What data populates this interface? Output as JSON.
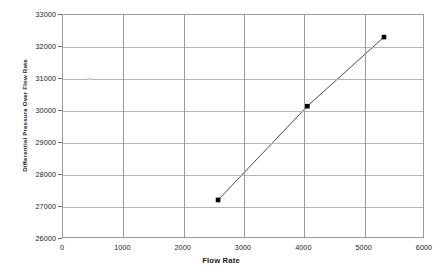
{
  "chart_data": {
    "type": "line",
    "title": "",
    "xlabel": "Flow Rate",
    "ylabel": "Differential Pressure Over Flow Rate",
    "xlim": [
      0,
      6000
    ],
    "ylim": [
      26000,
      33000
    ],
    "xticks": [
      0,
      1000,
      2000,
      3000,
      4000,
      5000,
      6000
    ],
    "yticks": [
      26000,
      27000,
      28000,
      29000,
      30000,
      31000,
      32000,
      33000
    ],
    "xtick_labels": [
      "0",
      "1000",
      "2000",
      "3000",
      "4000",
      "5000",
      "6000"
    ],
    "ytick_labels": [
      "26000",
      "27000",
      "28000",
      "29000",
      "30000",
      "31000",
      "32000",
      "33000"
    ],
    "grid": true,
    "legend": false,
    "legend_position": "none",
    "marker": "square",
    "marker_color": "#000000",
    "line_color": "#4a4a4a",
    "series": [
      {
        "name": "Differential Pressure Over Flow Rate",
        "x": [
          2570,
          4050,
          5320
        ],
        "y": [
          27220,
          30150,
          32310
        ],
        "points": [
          {
            "x": 2570,
            "y": 27220
          },
          {
            "x": 4050,
            "y": 30150
          },
          {
            "x": 5320,
            "y": 32310
          }
        ]
      }
    ]
  },
  "colors": {
    "grid_major": "#b4b4b4",
    "axis": "#9a9a9a",
    "text": "#1a1a1a",
    "background": "#ffffff"
  }
}
